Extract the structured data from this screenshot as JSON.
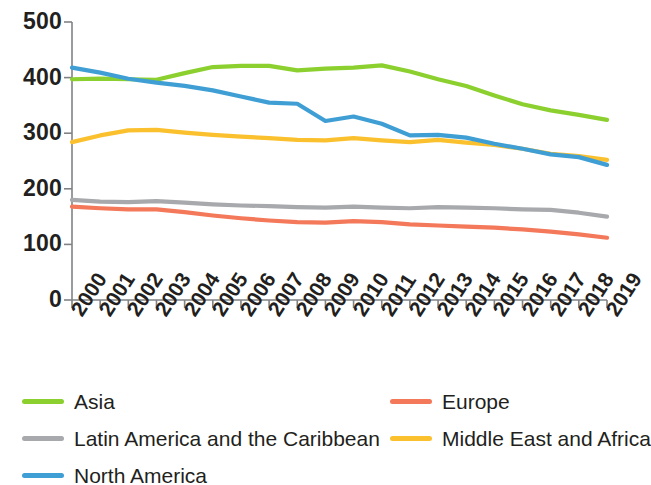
{
  "chart_data": {
    "type": "line",
    "title": "",
    "subtitle": "",
    "xlabel": "",
    "ylabel": "",
    "grid": false,
    "legend_position": "bottom",
    "xlim": [
      2000,
      2019
    ],
    "ylim": [
      0,
      500
    ],
    "y_ticks": [
      500,
      400,
      300,
      200,
      100,
      0
    ],
    "categories": [
      "2000",
      "2001",
      "2002",
      "2003",
      "2004",
      "2005",
      "2006",
      "2007",
      "2008",
      "2009",
      "2010",
      "2011",
      "2012",
      "2013",
      "2014",
      "2015",
      "2016",
      "2017",
      "2018",
      "2019"
    ],
    "series": [
      {
        "name": "Asia",
        "color": "#8CD02F",
        "values": [
          397,
          398,
          397,
          396,
          408,
          419,
          421,
          421,
          413,
          416,
          418,
          422,
          411,
          397,
          385,
          368,
          352,
          341,
          333,
          324
        ]
      },
      {
        "name": "Europe",
        "color": "#F4785A",
        "values": [
          168,
          165,
          163,
          163,
          158,
          152,
          147,
          143,
          140,
          139,
          142,
          140,
          136,
          134,
          132,
          130,
          127,
          123,
          118,
          112
        ]
      },
      {
        "name": "Latin America and the Caribbean",
        "color": "#A7A9AC",
        "values": [
          180,
          177,
          176,
          178,
          175,
          172,
          170,
          169,
          167,
          166,
          168,
          166,
          165,
          167,
          166,
          165,
          163,
          162,
          157,
          150
        ]
      },
      {
        "name": "Middle East and Africa",
        "color": "#FBC02D",
        "values": [
          284,
          296,
          305,
          306,
          301,
          297,
          294,
          291,
          288,
          287,
          291,
          287,
          284,
          288,
          283,
          279,
          272,
          263,
          259,
          252
        ]
      },
      {
        "name": "North America",
        "color": "#3F9FD5",
        "values": [
          418,
          409,
          398,
          391,
          385,
          377,
          366,
          355,
          353,
          322,
          330,
          317,
          296,
          297,
          292,
          281,
          272,
          262,
          257,
          243
        ]
      }
    ]
  },
  "y_axis": {
    "ticks": [
      {
        "label": "500",
        "value": 500
      },
      {
        "label": "400",
        "value": 400
      },
      {
        "label": "300",
        "value": 300
      },
      {
        "label": "200",
        "value": 200
      },
      {
        "label": "100",
        "value": 100
      },
      {
        "label": "0",
        "value": 0
      }
    ]
  },
  "legend": {
    "items": [
      {
        "label": "Asia",
        "color": "#8CD02F",
        "column": 0,
        "row": 0
      },
      {
        "label": "Europe",
        "color": "#F4785A",
        "column": 1,
        "row": 0
      },
      {
        "label": "Latin America and the Caribbean",
        "color": "#A7A9AC",
        "column": 0,
        "row": 1
      },
      {
        "label": "Middle East and Africa",
        "color": "#FBC02D",
        "column": 1,
        "row": 1
      },
      {
        "label": "North America",
        "color": "#3F9FD5",
        "column": 0,
        "row": 2
      }
    ]
  },
  "style": {
    "axis_color": "#808285",
    "text_color": "#231f20",
    "background": "#ffffff"
  }
}
